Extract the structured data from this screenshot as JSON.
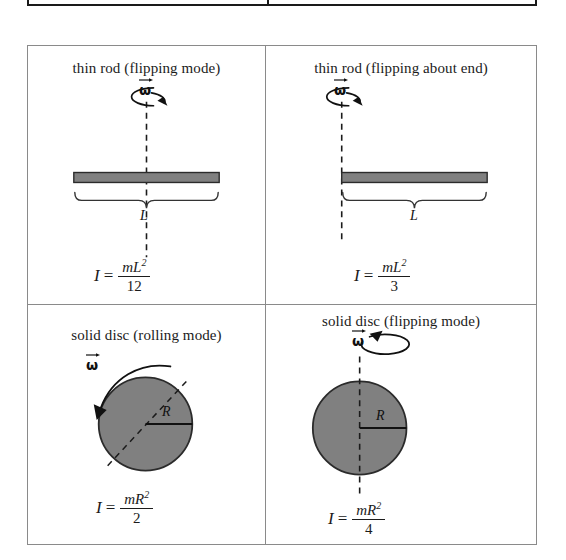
{
  "document": {
    "kind": "moment-of-inertia-reference-table",
    "top_fragment_note": ""
  },
  "colors": {
    "body_fill": "#808080",
    "body_stroke": "#2b2b2b",
    "table_border": "#8a8a8a",
    "fragment_border": "#1a1a1a",
    "ink": "#111111",
    "page_background": "#ffffff"
  },
  "table": {
    "rows": 2,
    "columns": 2,
    "cells": [
      {
        "id": "thin-rod-flipping-mode",
        "title": "thin rod (flipping mode)",
        "shape": "rod",
        "axis": "vertical dashed through center",
        "axis_position": "center",
        "omega_symbol": "ω",
        "omega_arrow_direction": "clockwise-from-above",
        "dimension_label": "L",
        "formula": {
          "lhs": "I",
          "equals": "=",
          "numerator": "mL",
          "numerator_exponent": "2",
          "denominator": "12",
          "plain": "I = mL²/12"
        }
      },
      {
        "id": "thin-rod-flipping-about-end",
        "title": "thin rod (flipping about end)",
        "shape": "rod",
        "axis": "vertical dashed through left end",
        "axis_position": "end",
        "omega_symbol": "ω",
        "omega_arrow_direction": "clockwise-from-above",
        "dimension_label": "L",
        "formula": {
          "lhs": "I",
          "equals": "=",
          "numerator": "mL",
          "numerator_exponent": "2",
          "denominator": "3",
          "plain": "I = mL²/3"
        }
      },
      {
        "id": "solid-disc-rolling-mode",
        "title": "solid disc (rolling mode)",
        "shape": "disc",
        "axis": "diagonal dashed through center",
        "axis_position": "center-diagonal",
        "omega_symbol": "ω",
        "omega_arrow_direction": "counterclockwise-arc-left",
        "dimension_label": "R",
        "formula": {
          "lhs": "I",
          "equals": "=",
          "numerator": "mR",
          "numerator_exponent": "2",
          "denominator": "2",
          "plain": "I = mR²/2"
        }
      },
      {
        "id": "solid-disc-flipping-mode",
        "title": "solid disc (flipping mode)",
        "shape": "disc",
        "axis": "vertical dashed through center",
        "axis_position": "center",
        "omega_symbol": "ω",
        "omega_arrow_direction": "counterclockwise-from-above",
        "dimension_label": "R",
        "formula": {
          "lhs": "I",
          "equals": "=",
          "numerator": "mR",
          "numerator_exponent": "2",
          "denominator": "4",
          "plain": "I = mR²/4"
        }
      }
    ]
  }
}
